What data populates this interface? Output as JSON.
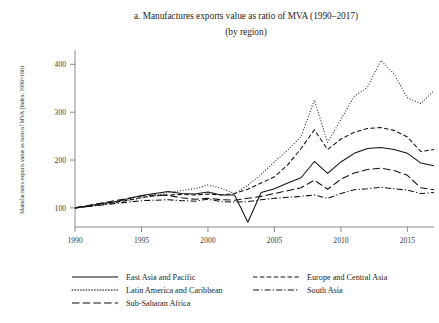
{
  "chart_data": {
    "type": "line",
    "title": "a. Manufactures exports value as ratio of MVA (1990–2017)",
    "subtitle": "(by region)",
    "xlabel": "",
    "ylabel": "Manufactures exports value as ratio of MVA (Index, 1990=100)",
    "xlim": [
      1990,
      2017
    ],
    "ylim": [
      60,
      430
    ],
    "xticks": [
      1990,
      1995,
      2000,
      2005,
      2010,
      2015
    ],
    "xtick_labels": [
      "1990",
      "1995",
      "2000",
      "2005",
      "2010",
      "2015"
    ],
    "yticks": [
      100,
      200,
      300,
      400
    ],
    "ytick_labels": [
      "100",
      "200",
      "300",
      "400"
    ],
    "grid": false,
    "legend_position": "bottom",
    "x": [
      1990,
      1991,
      1992,
      1993,
      1994,
      1995,
      1996,
      1997,
      1998,
      1999,
      2000,
      2001,
      2002,
      2003,
      2004,
      2005,
      2006,
      2007,
      2008,
      2009,
      2010,
      2011,
      2012,
      2013,
      2014,
      2015,
      2016,
      2017
    ],
    "series": [
      {
        "name": "East Asia and Pacific",
        "dash": "none",
        "values": [
          100,
          104,
          109,
          113,
          119,
          126,
          130,
          134,
          130,
          129,
          133,
          127,
          127,
          70,
          132,
          140,
          152,
          163,
          197,
          172,
          196,
          214,
          224,
          226,
          222,
          214,
          194,
          188
        ]
      },
      {
        "name": "Europe and Central Asia",
        "dash": "dashed",
        "values": [
          100,
          103,
          107,
          111,
          116,
          122,
          125,
          127,
          128,
          127,
          129,
          127,
          130,
          139,
          152,
          165,
          190,
          224,
          263,
          222,
          244,
          258,
          266,
          268,
          262,
          248,
          218,
          222
        ]
      },
      {
        "name": "Latin America and Caribbean",
        "dash": "dotted",
        "values": [
          100,
          104,
          108,
          112,
          116,
          120,
          126,
          132,
          136,
          140,
          148,
          141,
          130,
          147,
          170,
          196,
          221,
          249,
          325,
          237,
          285,
          333,
          352,
          408,
          380,
          330,
          318,
          345
        ]
      },
      {
        "name": "South Asia",
        "dash": "dashdot",
        "values": [
          100,
          103,
          106,
          109,
          112,
          115,
          116,
          117,
          115,
          114,
          118,
          113,
          112,
          113,
          117,
          120,
          122,
          124,
          127,
          120,
          130,
          138,
          140,
          143,
          140,
          137,
          130,
          132
        ]
      },
      {
        "name": "Sub-Saharan Africa",
        "dash": "longdash",
        "values": [
          100,
          105,
          110,
          115,
          120,
          125,
          127,
          126,
          121,
          118,
          120,
          117,
          116,
          120,
          124,
          130,
          136,
          142,
          158,
          139,
          160,
          173,
          180,
          183,
          178,
          168,
          142,
          138
        ]
      }
    ],
    "legend": [
      {
        "label": "East Asia and Pacific",
        "dash": "none"
      },
      {
        "label": "Europe and Central Asia",
        "dash": "dashed"
      },
      {
        "label": "Latin America and Caribbean",
        "dash": "dotted"
      },
      {
        "label": "South Asia",
        "dash": "dashdot"
      },
      {
        "label": "Sub-Saharan Africa",
        "dash": "longdash"
      }
    ],
    "colors": {
      "line": "#111111",
      "axis": "#6e6e6e",
      "text": "#1e1e1e",
      "background": "#ffffff"
    }
  }
}
